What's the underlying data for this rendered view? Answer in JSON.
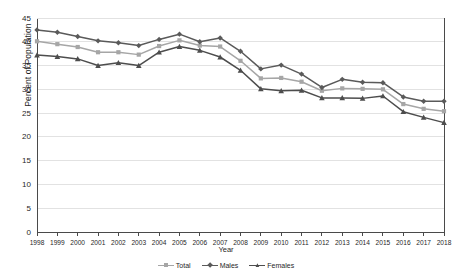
{
  "chart_data": {
    "type": "line",
    "title": "",
    "xlabel": "Year",
    "ylabel": "Percent of Population",
    "grid": true,
    "legend_position": "bottom",
    "xlim": [
      1998,
      2018
    ],
    "ylim": [
      0,
      45
    ],
    "ytick_step": 5,
    "yticks": [
      0,
      5,
      10,
      15,
      20,
      25,
      30,
      35,
      40,
      45
    ],
    "categories": [
      "1998",
      "1999",
      "2000",
      "2001",
      "2002",
      "2003",
      "2004",
      "2005",
      "2006",
      "2007",
      "2008",
      "2009",
      "2010",
      "2011",
      "2012",
      "2013",
      "2014",
      "2015",
      "2016",
      "2017",
      "2018"
    ],
    "series": [
      {
        "name": "Total",
        "color": "#a6a6a6",
        "marker": "square",
        "values": [
          40.1,
          39.5,
          38.9,
          37.8,
          37.8,
          37.3,
          39.1,
          40.3,
          39.2,
          39.0,
          36.0,
          32.3,
          32.4,
          31.6,
          29.7,
          30.2,
          30.1,
          30.0,
          26.9,
          25.9,
          25.4
        ]
      },
      {
        "name": "Males",
        "color": "#5a5a5a",
        "marker": "diamond",
        "values": [
          42.5,
          42.0,
          41.1,
          40.2,
          39.8,
          39.2,
          40.5,
          41.6,
          40.0,
          40.8,
          38.0,
          34.3,
          35.1,
          33.2,
          30.4,
          32.1,
          31.5,
          31.4,
          28.4,
          27.5,
          27.5
        ]
      },
      {
        "name": "Females",
        "color": "#4d4d4d",
        "marker": "triangle",
        "values": [
          37.2,
          36.9,
          36.4,
          35.0,
          35.6,
          35.0,
          37.8,
          39.0,
          38.2,
          36.8,
          34.0,
          30.1,
          29.7,
          29.8,
          28.2,
          28.2,
          28.1,
          28.6,
          25.3,
          24.1,
          23.0
        ]
      }
    ]
  },
  "axes": {
    "y_title": "Percent of Population",
    "x_title": "Year"
  },
  "legend": {
    "items": [
      {
        "label": "Total"
      },
      {
        "label": "Males"
      },
      {
        "label": "Females"
      }
    ]
  },
  "colors": {
    "total": "#a6a6a6",
    "males": "#5a5a5a",
    "females": "#4d4d4d",
    "axis": "#4a4a4a",
    "grid": "#e2e2e2",
    "background": "#ffffff"
  }
}
